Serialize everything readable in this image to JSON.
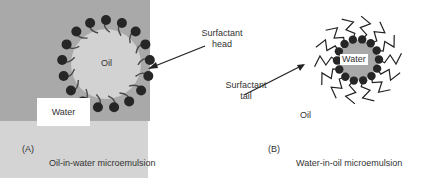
{
  "figure": {
    "panel_a": {
      "letter": "(A)",
      "caption": "Oil-in-water microemulsion",
      "core_label": "Oil",
      "medium_label": "Water",
      "colors": {
        "medium": "#a9a9a9",
        "core": "#d2d2d2",
        "head": "#262626",
        "tail": "#444444"
      }
    },
    "panel_b": {
      "letter": "(B)",
      "caption": "Water-in-oil microemulsion",
      "core_label": "Water",
      "medium_label": "Oil",
      "colors": {
        "medium": "#d4d4d4",
        "core": "#aaaaaa",
        "head": "#262626",
        "tail": "#222222"
      }
    },
    "annotations": {
      "head_line1": "Surfactant",
      "head_line2": "head",
      "tail_line1": "Surfactant",
      "tail_line2": "tail"
    }
  }
}
